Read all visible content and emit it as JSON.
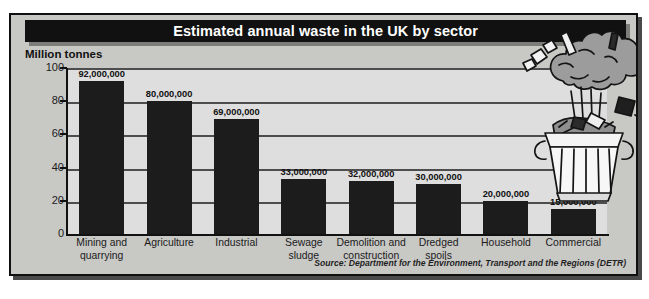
{
  "figure": {
    "title": "Estimated annual waste in the UK by sector",
    "units_label": "Million tonnes",
    "source": "Source: Department for the Environment, Transport and the Regions (DETR)",
    "illustration_name": "overflowing-dustbin-illustration"
  },
  "colors": {
    "bar": "#1c1c1c",
    "plot_background": "#dedede",
    "figure_background": "#c8c8c5",
    "title_bar": "#111111",
    "title_text": "#ffffff",
    "gridline": "#4d4d4d",
    "axis": "#111111"
  },
  "chart_data": {
    "type": "bar",
    "title": "Estimated annual waste in the UK by sector",
    "subtitle": "",
    "xlabel": "",
    "ylabel": "Million tonnes",
    "ylim": [
      0,
      100
    ],
    "yticks": [
      0,
      20,
      40,
      60,
      80,
      100
    ],
    "grid": true,
    "legend": false,
    "categories": [
      "Mining and quarrying",
      "Agriculture",
      "Industrial",
      "Sewage sludge",
      "Demolition and construction",
      "Dredged spoils",
      "Household",
      "Commercial"
    ],
    "category_lines": [
      [
        "Mining and",
        "quarrying"
      ],
      [
        "Agriculture"
      ],
      [
        "Industrial"
      ],
      [
        "Sewage",
        "sludge"
      ],
      [
        "Demolition and",
        "construction"
      ],
      [
        "Dredged",
        "spoils"
      ],
      [
        "Household"
      ],
      [
        "Commercial"
      ]
    ],
    "values": [
      92,
      80,
      69,
      33,
      32,
      30,
      20,
      15
    ],
    "value_labels": [
      "92,000,000",
      "80,000,000",
      "69,000,000",
      "33,000,000",
      "32,000,000",
      "30,000,000",
      "20,000,000",
      "15,000,000"
    ],
    "units": "million tonnes",
    "source": "Source: Department for the Environment, Transport and the Regions (DETR)"
  }
}
